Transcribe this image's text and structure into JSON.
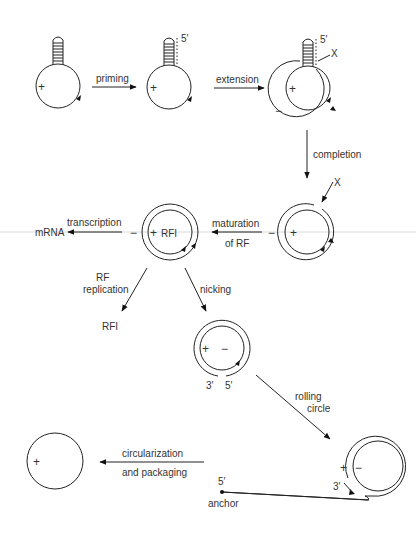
{
  "diagram": {
    "title": "",
    "colors": {
      "line": "#222222",
      "text": "#333333",
      "background": "#ffffff",
      "guide_line": "#d0d0d0"
    },
    "nodes": {
      "ss_hairpin": {
        "strand": "+"
      },
      "primed": {
        "strand": "+",
        "end_label": "5′"
      },
      "extended": {
        "plus": "+",
        "minus": "−",
        "end_label": "5′",
        "x_label": "X"
      },
      "completed": {
        "plus": "+",
        "minus": "−",
        "x_label": "X"
      },
      "rfi": {
        "plus": "+",
        "minus": "−",
        "name": "RFI"
      },
      "rfi_product": {
        "label": "RFI"
      },
      "mrna": {
        "label": "mRNA"
      },
      "nicked": {
        "plus": "+",
        "minus": "−",
        "end3": "3′",
        "end5": "5′"
      },
      "rolling": {
        "plus": "+",
        "minus": "−",
        "end3": "3′",
        "end5": "5′",
        "anchor": "anchor"
      },
      "ss_circle": {
        "strand": "+"
      }
    },
    "steps": {
      "priming": "priming",
      "extension": "extension",
      "completion": "completion",
      "maturation_line1": "maturation",
      "maturation_line2": "of RF",
      "transcription": "transcription",
      "rf_replication_line1": "RF",
      "rf_replication_line2": "replication",
      "nicking": "nicking",
      "rolling_line1": "rolling",
      "rolling_line2": "circle",
      "circ_line1": "circularization",
      "circ_line2": "and packaging"
    }
  }
}
